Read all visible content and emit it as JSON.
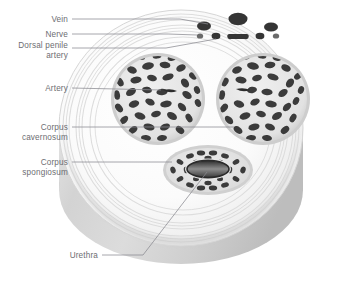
{
  "diagram": {
    "type": "anatomical-cross-section",
    "view": "transverse cylinder, oblique 3D",
    "palette": {
      "background": "#ffffff",
      "tissue_light": "#f2f2f2",
      "tissue_mid": "#d8d8d8",
      "tissue_shadow": "#b9b9b9",
      "cavity_dark": "#3a3a3a",
      "vessel_dark": "#2f2f2f",
      "leader_line": "#8a8a90",
      "label_text": "#6d6d72"
    },
    "labels": [
      {
        "id": "vein",
        "lines": [
          "Vein"
        ],
        "text": "Vein",
        "text_x": 68,
        "text_y": 22,
        "leader": [
          [
            72,
            19
          ],
          [
            180,
            19
          ],
          [
            206,
            26
          ]
        ]
      },
      {
        "id": "nerve",
        "lines": [
          "Nerve"
        ],
        "text": "Nerve",
        "text_x": 68,
        "text_y": 37,
        "leader": [
          [
            72,
            34
          ],
          [
            172,
            34
          ],
          [
            192,
            45
          ]
        ]
      },
      {
        "id": "dorsal-penile-artery",
        "lines": [
          "Dorsal penile",
          "artery"
        ],
        "text": "Dorsal penile artery",
        "text_x": 68,
        "text_y": 51,
        "leader": [
          [
            72,
            48
          ],
          [
            170,
            48
          ],
          [
            198,
            48
          ]
        ]
      },
      {
        "id": "artery",
        "lines": [
          "Artery"
        ],
        "text": "Artery",
        "text_x": 68,
        "text_y": 91,
        "leader": [
          [
            72,
            88
          ],
          [
            156,
            88
          ]
        ]
      },
      {
        "id": "corpus-cavernosum",
        "lines": [
          "Corpus",
          "cavernosum"
        ],
        "text": "Corpus cavernosum",
        "text_x": 68,
        "text_y": 130,
        "leader": [
          [
            72,
            127
          ],
          [
            222,
            127
          ]
        ]
      },
      {
        "id": "corpus-spongiosum",
        "lines": [
          "Corpus",
          "spongiosum"
        ],
        "text": "Corpus spongiosum",
        "text_x": 68,
        "text_y": 165,
        "leader": [
          [
            72,
            162
          ],
          [
            172,
            162
          ]
        ]
      },
      {
        "id": "urethra",
        "lines": [
          "Urethra"
        ],
        "text": "Urethra",
        "text_x": 98,
        "text_y": 258,
        "leader": [
          [
            102,
            255
          ],
          [
            142,
            255
          ],
          [
            205,
            172
          ]
        ]
      }
    ],
    "structures": [
      {
        "id": "dorsal-vein",
        "name": "Dorsal vein",
        "shape": "ellipse",
        "cx": 238,
        "cy": 19,
        "rx": 9,
        "ry": 6
      },
      {
        "id": "vein-left",
        "name": "Superficial vein left",
        "shape": "ellipse",
        "cx": 204,
        "cy": 26,
        "rx": 7,
        "ry": 4.5
      },
      {
        "id": "vein-right",
        "name": "Superficial vein right",
        "shape": "ellipse",
        "cx": 271,
        "cy": 27,
        "rx": 7,
        "ry": 4.5
      },
      {
        "id": "dorsal-artery-left",
        "name": "Dorsal penile artery L",
        "shape": "ellipse",
        "cx": 216,
        "cy": 36,
        "rx": 4,
        "ry": 3
      },
      {
        "id": "nerve-small-left",
        "name": "Dorsal nerve L",
        "shape": "ellipse",
        "cx": 200,
        "cy": 36,
        "rx": 3,
        "ry": 2.4
      },
      {
        "id": "deep-dorsal-vein",
        "name": "Deep dorsal vein",
        "shape": "lens",
        "cx": 238,
        "cy": 37,
        "rx": 9,
        "ry": 4
      },
      {
        "id": "dorsal-artery-right",
        "name": "Dorsal penile artery R",
        "shape": "ellipse",
        "cx": 260,
        "cy": 36,
        "rx": 4,
        "ry": 3
      },
      {
        "id": "nerve-small-right",
        "name": "Dorsal nerve R",
        "shape": "ellipse",
        "cx": 276,
        "cy": 36,
        "rx": 3,
        "ry": 2.4
      },
      {
        "id": "corpus-cavernosum-left",
        "name": "Corpus cavernosum left",
        "cx": 158,
        "cy": 99,
        "rx": 46,
        "ry": 45
      },
      {
        "id": "corpus-cavernosum-right",
        "name": "Corpus cavernosum right",
        "cx": 263,
        "cy": 99,
        "rx": 46,
        "ry": 45
      },
      {
        "id": "deep-artery-left",
        "name": "Deep cavernous artery L",
        "shape": "slit",
        "cx": 170,
        "cy": 92,
        "rx": 8,
        "ry": 2.5
      },
      {
        "id": "deep-artery-right",
        "name": "Deep cavernous artery R",
        "shape": "slit",
        "cx": 243,
        "cy": 90,
        "rx": 8,
        "ry": 2.5
      },
      {
        "id": "corpus-spongiosum",
        "name": "Corpus spongiosum",
        "cx": 208,
        "cy": 170,
        "rx": 43,
        "ry": 23
      },
      {
        "id": "urethra-lumen",
        "name": "Urethra lumen",
        "cx": 208,
        "cy": 168,
        "rx": 20,
        "ry": 8
      }
    ]
  }
}
